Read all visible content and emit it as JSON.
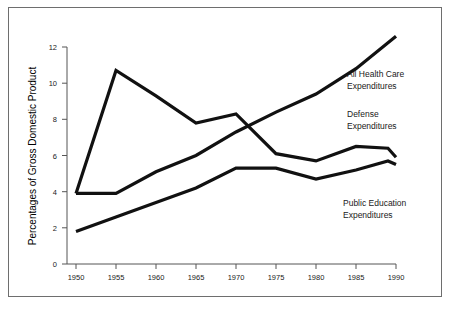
{
  "chart_data": {
    "type": "line",
    "title": "",
    "xlabel": "",
    "ylabel": "Percentages of Gross Domestic Product",
    "xlim": [
      1950,
      1990
    ],
    "ylim": [
      0,
      12
    ],
    "grid": false,
    "legend_position": "inline-right-annotations",
    "x_ticks": [
      "1950",
      "1955",
      "1960",
      "1965",
      "1970",
      "1975",
      "1980",
      "1985",
      "1990"
    ],
    "y_ticks": [
      "0",
      "2",
      "4",
      "6",
      "8",
      "10",
      "12"
    ],
    "x": [
      1950,
      1955,
      1960,
      1965,
      1970,
      1975,
      1980,
      1985,
      1989,
      1990
    ],
    "series": [
      {
        "name": "All Health Care Expenditures",
        "color": "#111111",
        "x": [
          1950,
          1955,
          1960,
          1965,
          1970,
          1975,
          1980,
          1985,
          1990
        ],
        "values": [
          3.9,
          3.9,
          5.1,
          6.0,
          7.3,
          8.4,
          9.4,
          10.8,
          12.6
        ]
      },
      {
        "name": "Defense Expenditures",
        "color": "#111111",
        "x": [
          1950,
          1955,
          1960,
          1965,
          1970,
          1975,
          1980,
          1985,
          1989,
          1990
        ],
        "values": [
          3.9,
          10.7,
          9.3,
          7.8,
          8.3,
          6.1,
          5.7,
          6.5,
          6.4,
          5.9
        ]
      },
      {
        "name": "Public Education Expenditures",
        "color": "#111111",
        "x": [
          1950,
          1955,
          1960,
          1965,
          1970,
          1975,
          1980,
          1985,
          1989,
          1990
        ],
        "values": [
          1.8,
          2.6,
          3.4,
          4.2,
          5.3,
          5.3,
          4.7,
          5.2,
          5.7,
          5.5
        ]
      }
    ],
    "annotations": [
      {
        "text_line1": "All Health Care",
        "text_line2": "Expenditures"
      },
      {
        "text_line1": "Defense",
        "text_line2": "Expenditures"
      },
      {
        "text_line1": "Public Education",
        "text_line2": "Expenditures"
      }
    ]
  },
  "axis": {
    "y_title": "Percentages of Gross Domestic Product"
  },
  "annotations": {
    "health_line1": "All Health Care",
    "health_line2": "Expenditures",
    "defense_line1": "Defense",
    "defense_line2": "Expenditures",
    "education_line1": "Public Education",
    "education_line2": "Expenditures"
  },
  "ticks": {
    "x": [
      "1950",
      "1955",
      "1960",
      "1965",
      "1970",
      "1975",
      "1980",
      "1985",
      "1990"
    ],
    "y": [
      "0",
      "2",
      "4",
      "6",
      "8",
      "10",
      "12"
    ]
  },
  "colors": {
    "line": "#111111",
    "frame": "#6e6e6e",
    "axis": "#555555",
    "text": "#1a1a1a"
  }
}
